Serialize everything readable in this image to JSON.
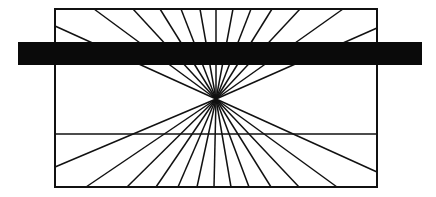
{
  "colors": {
    "background": "#ffffff",
    "ink": "#111111",
    "bar": "#0a0a0a"
  },
  "figure": {
    "frame": {
      "x1": 55,
      "y1": 9,
      "x2": 377,
      "y2": 187
    },
    "center": {
      "x": 216,
      "y": 99
    },
    "horizontal_line_y": 134,
    "occluding_bar": {
      "x": 18,
      "y": 42,
      "width": 404,
      "height": 23
    },
    "ray_endpoints_top_x": [
      94,
      133,
      160,
      181,
      200,
      216,
      233,
      251,
      272,
      300,
      343
    ],
    "ray_endpoints_bottom_x": [
      86,
      127,
      156,
      178,
      197,
      214,
      231,
      249,
      271,
      299,
      337
    ],
    "ray_endpoints_left_y": [
      26,
      167
    ],
    "ray_endpoints_right_y": [
      28,
      172
    ]
  }
}
